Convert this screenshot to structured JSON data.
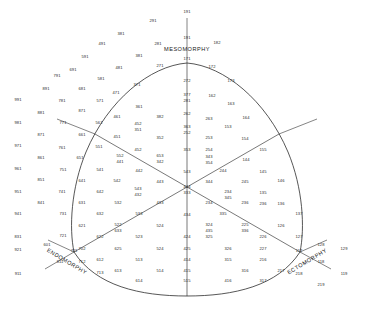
{
  "figure": {
    "type": "somatotype-triangle-plot"
  },
  "axes": {
    "mesomorphy": "MESOMORPHY",
    "endomorphy": "ENDOMORPHY",
    "ectomorphy": "ECTOMORPHY"
  },
  "chart_data": {
    "type": "scatter",
    "xlabel": "",
    "ylabel": "",
    "grid": false,
    "legend": null,
    "axis_labels": [
      "MESOMORPHY",
      "ENDOMORPHY",
      "ECTOMORPHY"
    ],
    "center_code": "444",
    "center_code_alt": "333",
    "cells": [
      {
        "code": "191",
        "x": 187,
        "y": 12
      },
      {
        "code": "291",
        "x": 153,
        "y": 21
      },
      {
        "code": "191",
        "x": 187,
        "y": 38
      },
      {
        "code": "381",
        "x": 121,
        "y": 34
      },
      {
        "code": "281",
        "x": 158,
        "y": 44
      },
      {
        "code": "182",
        "x": 217,
        "y": 43
      },
      {
        "code": "491",
        "x": 102,
        "y": 44
      },
      {
        "code": "591",
        "x": 85,
        "y": 57
      },
      {
        "code": "381",
        "x": 139,
        "y": 56
      },
      {
        "code": "691",
        "x": 73,
        "y": 70
      },
      {
        "code": "481",
        "x": 119,
        "y": 68
      },
      {
        "code": "791",
        "x": 57,
        "y": 76
      },
      {
        "code": "581",
        "x": 101,
        "y": 79
      },
      {
        "code": "371",
        "x": 137,
        "y": 85
      },
      {
        "code": "271",
        "x": 160,
        "y": 66
      },
      {
        "code": "171",
        "x": 187,
        "y": 59
      },
      {
        "code": "172",
        "x": 212,
        "y": 67
      },
      {
        "code": "173",
        "x": 231,
        "y": 81
      },
      {
        "code": "272",
        "x": 187,
        "y": 81
      },
      {
        "code": "891",
        "x": 46,
        "y": 89
      },
      {
        "code": "681",
        "x": 82,
        "y": 89
      },
      {
        "code": "471",
        "x": 116,
        "y": 93
      },
      {
        "code": "991",
        "x": 18,
        "y": 100
      },
      {
        "code": "781",
        "x": 62,
        "y": 101
      },
      {
        "code": "571",
        "x": 100,
        "y": 101
      },
      {
        "code": "361",
        "x": 139,
        "y": 107
      },
      {
        "code": "377",
        "x": 187,
        "y": 95
      },
      {
        "code": "281",
        "x": 187,
        "y": 101
      },
      {
        "code": "162",
        "x": 212,
        "y": 96
      },
      {
        "code": "881",
        "x": 41,
        "y": 113
      },
      {
        "code": "871",
        "x": 82,
        "y": 111
      },
      {
        "code": "461",
        "x": 117,
        "y": 117
      },
      {
        "code": "382",
        "x": 160,
        "y": 117
      },
      {
        "code": "262",
        "x": 187,
        "y": 114
      },
      {
        "code": "163",
        "x": 231,
        "y": 104
      },
      {
        "code": "263",
        "x": 209,
        "y": 119
      },
      {
        "code": "981",
        "x": 18,
        "y": 123
      },
      {
        "code": "771",
        "x": 63,
        "y": 123
      },
      {
        "code": "561",
        "x": 99,
        "y": 123
      },
      {
        "code": "452",
        "x": 138,
        "y": 124
      },
      {
        "code": "351",
        "x": 138,
        "y": 130
      },
      {
        "code": "363",
        "x": 187,
        "y": 127
      },
      {
        "code": "252",
        "x": 187,
        "y": 133
      },
      {
        "code": "164",
        "x": 246,
        "y": 118
      },
      {
        "code": "153",
        "x": 228,
        "y": 127
      },
      {
        "code": "871",
        "x": 41,
        "y": 135
      },
      {
        "code": "661",
        "x": 82,
        "y": 135
      },
      {
        "code": "451",
        "x": 117,
        "y": 137
      },
      {
        "code": "352",
        "x": 160,
        "y": 138
      },
      {
        "code": "253",
        "x": 209,
        "y": 138
      },
      {
        "code": "154",
        "x": 245,
        "y": 139
      },
      {
        "code": "971",
        "x": 18,
        "y": 146
      },
      {
        "code": "761",
        "x": 62,
        "y": 148
      },
      {
        "code": "551",
        "x": 99,
        "y": 147
      },
      {
        "code": "452",
        "x": 138,
        "y": 150
      },
      {
        "code": "353",
        "x": 187,
        "y": 150
      },
      {
        "code": "254",
        "x": 209,
        "y": 150
      },
      {
        "code": "155",
        "x": 263,
        "y": 150
      },
      {
        "code": "861",
        "x": 41,
        "y": 158
      },
      {
        "code": "651",
        "x": 80,
        "y": 158
      },
      {
        "code": "552",
        "x": 120,
        "y": 156
      },
      {
        "code": "441",
        "x": 120,
        "y": 162
      },
      {
        "code": "653",
        "x": 160,
        "y": 156
      },
      {
        "code": "342",
        "x": 160,
        "y": 162
      },
      {
        "code": "343",
        "x": 209,
        "y": 157
      },
      {
        "code": "354",
        "x": 209,
        "y": 163
      },
      {
        "code": "144",
        "x": 246,
        "y": 160
      },
      {
        "code": "961",
        "x": 18,
        "y": 169
      },
      {
        "code": "751",
        "x": 63,
        "y": 170
      },
      {
        "code": "541",
        "x": 100,
        "y": 170
      },
      {
        "code": "442",
        "x": 139,
        "y": 171
      },
      {
        "code": "543",
        "x": 187,
        "y": 172
      },
      {
        "code": "244",
        "x": 223,
        "y": 171
      },
      {
        "code": "145",
        "x": 263,
        "y": 172
      },
      {
        "code": "851",
        "x": 41,
        "y": 180
      },
      {
        "code": "641",
        "x": 82,
        "y": 181
      },
      {
        "code": "542",
        "x": 117,
        "y": 181
      },
      {
        "code": "443",
        "x": 160,
        "y": 182
      },
      {
        "code": "444",
        "x": 187,
        "y": 187
      },
      {
        "code": "333",
        "x": 187,
        "y": 193
      },
      {
        "code": "344",
        "x": 209,
        "y": 182
      },
      {
        "code": "245",
        "x": 245,
        "y": 182
      },
      {
        "code": "146",
        "x": 281,
        "y": 181
      },
      {
        "code": "951",
        "x": 18,
        "y": 192
      },
      {
        "code": "741",
        "x": 62,
        "y": 192
      },
      {
        "code": "642",
        "x": 100,
        "y": 192
      },
      {
        "code": "543",
        "x": 138,
        "y": 189
      },
      {
        "code": "432",
        "x": 138,
        "y": 195
      },
      {
        "code": "234",
        "x": 228,
        "y": 192
      },
      {
        "code": "345",
        "x": 228,
        "y": 198
      },
      {
        "code": "135",
        "x": 263,
        "y": 193
      },
      {
        "code": "841",
        "x": 41,
        "y": 203
      },
      {
        "code": "631",
        "x": 82,
        "y": 203
      },
      {
        "code": "532",
        "x": 118,
        "y": 203
      },
      {
        "code": "433",
        "x": 160,
        "y": 203
      },
      {
        "code": "234",
        "x": 209,
        "y": 203
      },
      {
        "code": "236",
        "x": 245,
        "y": 203
      },
      {
        "code": "236",
        "x": 263,
        "y": 204
      },
      {
        "code": "136",
        "x": 281,
        "y": 204
      },
      {
        "code": "941",
        "x": 18,
        "y": 214
      },
      {
        "code": "731",
        "x": 63,
        "y": 214
      },
      {
        "code": "632",
        "x": 100,
        "y": 214
      },
      {
        "code": "533",
        "x": 139,
        "y": 214
      },
      {
        "code": "434",
        "x": 187,
        "y": 215
      },
      {
        "code": "335",
        "x": 223,
        "y": 214
      },
      {
        "code": "137",
        "x": 299,
        "y": 214
      },
      {
        "code": "831",
        "x": 18,
        "y": 237
      },
      {
        "code": "621",
        "x": 82,
        "y": 226
      },
      {
        "code": "522",
        "x": 118,
        "y": 225
      },
      {
        "code": "633",
        "x": 118,
        "y": 231
      },
      {
        "code": "524",
        "x": 160,
        "y": 226
      },
      {
        "code": "324",
        "x": 209,
        "y": 225
      },
      {
        "code": "435",
        "x": 209,
        "y": 231
      },
      {
        "code": "225",
        "x": 245,
        "y": 225
      },
      {
        "code": "336",
        "x": 245,
        "y": 231
      },
      {
        "code": "126",
        "x": 281,
        "y": 226
      },
      {
        "code": "721",
        "x": 63,
        "y": 236
      },
      {
        "code": "622",
        "x": 100,
        "y": 237
      },
      {
        "code": "523",
        "x": 139,
        "y": 237
      },
      {
        "code": "424",
        "x": 187,
        "y": 237
      },
      {
        "code": "325",
        "x": 209,
        "y": 237
      },
      {
        "code": "226",
        "x": 263,
        "y": 237
      },
      {
        "code": "127",
        "x": 299,
        "y": 237
      },
      {
        "code": "921",
        "x": 18,
        "y": 250
      },
      {
        "code": "601",
        "x": 47,
        "y": 245
      },
      {
        "code": "711",
        "x": 74,
        "y": 251
      },
      {
        "code": "702",
        "x": 82,
        "y": 249
      },
      {
        "code": "625",
        "x": 118,
        "y": 249
      },
      {
        "code": "524",
        "x": 160,
        "y": 249
      },
      {
        "code": "425",
        "x": 187,
        "y": 249
      },
      {
        "code": "326",
        "x": 228,
        "y": 249
      },
      {
        "code": "227",
        "x": 263,
        "y": 249
      },
      {
        "code": "117",
        "x": 299,
        "y": 251
      },
      {
        "code": "128",
        "x": 321,
        "y": 245
      },
      {
        "code": "129",
        "x": 344,
        "y": 249
      },
      {
        "code": "811",
        "x": 60,
        "y": 262
      },
      {
        "code": "712",
        "x": 82,
        "y": 262
      },
      {
        "code": "612",
        "x": 100,
        "y": 260
      },
      {
        "code": "513",
        "x": 139,
        "y": 260
      },
      {
        "code": "414",
        "x": 187,
        "y": 260
      },
      {
        "code": "315",
        "x": 228,
        "y": 260
      },
      {
        "code": "216",
        "x": 263,
        "y": 260
      },
      {
        "code": "118",
        "x": 321,
        "y": 262
      },
      {
        "code": "911",
        "x": 18,
        "y": 274
      },
      {
        "code": "713",
        "x": 100,
        "y": 273
      },
      {
        "code": "613",
        "x": 118,
        "y": 271
      },
      {
        "code": "514",
        "x": 160,
        "y": 271
      },
      {
        "code": "415",
        "x": 187,
        "y": 271
      },
      {
        "code": "316",
        "x": 245,
        "y": 271
      },
      {
        "code": "217",
        "x": 281,
        "y": 271
      },
      {
        "code": "218",
        "x": 299,
        "y": 274
      },
      {
        "code": "119",
        "x": 344,
        "y": 274
      },
      {
        "code": "614",
        "x": 139,
        "y": 281
      },
      {
        "code": "515",
        "x": 187,
        "y": 281
      },
      {
        "code": "416",
        "x": 228,
        "y": 281
      },
      {
        "code": "317",
        "x": 263,
        "y": 281
      },
      {
        "code": "219",
        "x": 321,
        "y": 285
      }
    ]
  }
}
